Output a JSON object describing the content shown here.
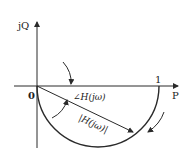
{
  "diagram": {
    "type": "polar-plot",
    "title": "",
    "axes": {
      "vertical_label": "jQ",
      "horizontal_label": "P",
      "origin_label": "0",
      "unit_tick_label": "1"
    },
    "annotations": {
      "angle_label": "∠H(jω)",
      "magnitude_label": "|H(jω)|"
    },
    "curve": {
      "shape": "lower semicircle",
      "from": [
        0,
        0
      ],
      "to": [
        1,
        0
      ],
      "direction": "clockwise from 1 toward 0"
    },
    "colors": {
      "stroke": "#2a2a2a",
      "text": "#222222",
      "background": "#ffffff"
    }
  }
}
